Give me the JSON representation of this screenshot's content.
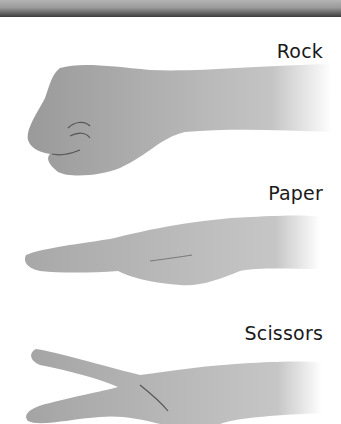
{
  "header": {
    "bar_colors": [
      "#b4b4b4",
      "#3c3c3c"
    ]
  },
  "gestures": [
    {
      "label": "Rock",
      "icon": "fist-hand-icon"
    },
    {
      "label": "Paper",
      "icon": "flat-hand-icon"
    },
    {
      "label": "Scissors",
      "icon": "v-sign-hand-icon"
    }
  ]
}
